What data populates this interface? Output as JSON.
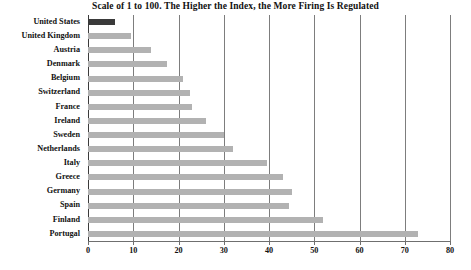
{
  "chart_data": {
    "type": "bar",
    "orientation": "horizontal",
    "title": "Scale of 1 to 100.  The Higher the Index, the More Firing Is Regulated",
    "xlabel": "",
    "ylabel": "",
    "xlim": [
      0,
      80
    ],
    "xticks": [
      0,
      10,
      20,
      30,
      40,
      50,
      60,
      70,
      80
    ],
    "xtick_labels": [
      "0",
      "10",
      "20",
      "30",
      "40",
      "50",
      "60",
      "70",
      "80"
    ],
    "grid": true,
    "grid_axis": "x",
    "legend": false,
    "categories": [
      "United States",
      "United Kingdom",
      "Austria",
      "Denmark",
      "Belgium",
      "Switzerland",
      "France",
      "Ireland",
      "Sweden",
      "Netherlands",
      "Italy",
      "Greece",
      "Germany",
      "Spain",
      "Finland",
      "Portugal"
    ],
    "values": [
      6,
      9.5,
      14,
      17.5,
      21,
      22.5,
      23,
      26,
      30,
      32,
      39.5,
      43,
      45,
      44.5,
      52,
      73
    ],
    "highlight_category": "United States",
    "colors": {
      "bar": "#b2b2b2",
      "bar_highlight": "#3a3a3a",
      "grid": "#7d7d7d",
      "axis": "#6f6f6f",
      "text": "#111111",
      "background": "#ffffff"
    }
  }
}
